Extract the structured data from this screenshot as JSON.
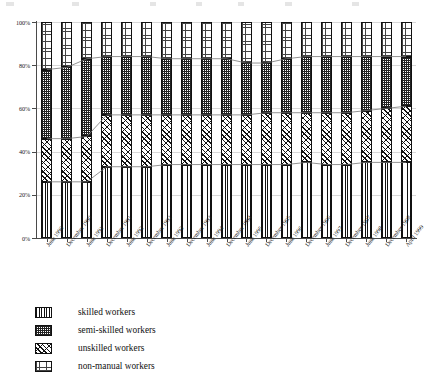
{
  "chart_data": {
    "type": "bar",
    "subtype": "100% stacked bar",
    "title": "",
    "xlabel": "",
    "ylabel": "",
    "ylim": [
      0,
      100
    ],
    "ytick_labels": [
      "0%",
      "20%",
      "40%",
      "60%",
      "80%",
      "100%"
    ],
    "ytick_values": [
      0,
      20,
      40,
      60,
      80,
      100
    ],
    "grid": true,
    "legend_position": "bottom-left",
    "categories": [
      "June 1990",
      "December 1990",
      "June 1991",
      "December 1991",
      "June 1992",
      "December 1992",
      "June 1993",
      "December 1993",
      "June 1994",
      "December 1994",
      "June 1995",
      "December 1995",
      "June 1996",
      "December 1996",
      "June 1997",
      "December 1997",
      "June 1998",
      "December 1998",
      "April 1999"
    ],
    "series": [
      {
        "name": "skilled workers",
        "pattern": "vertical-lines",
        "values": [
          26,
          26,
          26,
          33,
          33,
          33,
          34,
          34,
          34,
          34,
          34,
          34,
          34,
          35,
          34,
          34,
          35,
          35,
          35
        ]
      },
      {
        "name": "unskilled workers",
        "pattern": "diagonal-hatch",
        "values": [
          20,
          20,
          21,
          24,
          24,
          24,
          23,
          23,
          23,
          23,
          23,
          24,
          24,
          23,
          24,
          24,
          24,
          25,
          26
        ]
      },
      {
        "name": "semi-skilled workers",
        "pattern": "dense-dots",
        "values": [
          32,
          33,
          36,
          27,
          27,
          27,
          26,
          26,
          26,
          26,
          24,
          23,
          25,
          26,
          26,
          26,
          25,
          24,
          23
        ]
      },
      {
        "name": "non-manual workers",
        "pattern": "light-dots",
        "values": [
          22,
          21,
          17,
          16,
          16,
          16,
          17,
          17,
          17,
          17,
          19,
          19,
          17,
          16,
          16,
          16,
          16,
          16,
          16
        ]
      }
    ],
    "stack_order_bottom_to_top": [
      "skilled workers",
      "unskilled workers",
      "semi-skilled workers",
      "non-manual workers"
    ],
    "connector_lines": true,
    "annotations": []
  },
  "legend": {
    "items": [
      {
        "label": "skilled workers",
        "pattern": "vertical-lines"
      },
      {
        "label": "semi-skilled workers",
        "pattern": "dense-dots"
      },
      {
        "label": "unskilled workers",
        "pattern": "diagonal-hatch"
      },
      {
        "label": "non-manual workers",
        "pattern": "light-dots"
      }
    ]
  }
}
